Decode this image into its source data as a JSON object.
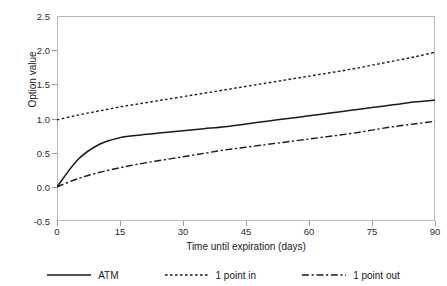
{
  "chart_data": {
    "type": "line",
    "title": "",
    "xlabel": "Time until expiration (days)",
    "ylabel": "Option value",
    "xlim": [
      0,
      90
    ],
    "ylim": [
      -0.5,
      2.5
    ],
    "xticks": [
      "0",
      "15",
      "30",
      "45",
      "60",
      "75",
      "90"
    ],
    "yticks": [
      "2.5",
      "2.0",
      "1.5",
      "1.0",
      "0.5",
      "0.0",
      "-0.5"
    ],
    "grid": false,
    "legend_position": "bottom",
    "x": [
      0,
      5,
      10,
      15,
      20,
      25,
      30,
      35,
      40,
      45,
      50,
      55,
      60,
      65,
      70,
      75,
      80,
      85,
      90
    ],
    "series": [
      {
        "name": "ATM",
        "style": "solid",
        "color": "#1a1a1a",
        "values": [
          0.0,
          0.4,
          0.62,
          0.72,
          0.76,
          0.79,
          0.82,
          0.85,
          0.88,
          0.92,
          0.96,
          1.0,
          1.04,
          1.08,
          1.12,
          1.16,
          1.2,
          1.24,
          1.27
        ]
      },
      {
        "name": "1 point in",
        "style": "dotted",
        "color": "#1a1a1a",
        "values": [
          0.98,
          1.05,
          1.11,
          1.17,
          1.22,
          1.27,
          1.32,
          1.37,
          1.42,
          1.47,
          1.52,
          1.57,
          1.62,
          1.67,
          1.72,
          1.78,
          1.84,
          1.9,
          1.97
        ]
      },
      {
        "name": "1 point out",
        "style": "dashdot",
        "color": "#1a1a1a",
        "values": [
          0.0,
          0.12,
          0.21,
          0.28,
          0.34,
          0.39,
          0.44,
          0.49,
          0.54,
          0.58,
          0.62,
          0.66,
          0.7,
          0.74,
          0.78,
          0.83,
          0.88,
          0.92,
          0.96
        ]
      }
    ]
  },
  "legend": {
    "entries": [
      {
        "label": "ATM"
      },
      {
        "label": "1 point in"
      },
      {
        "label": "1 point out"
      }
    ]
  }
}
